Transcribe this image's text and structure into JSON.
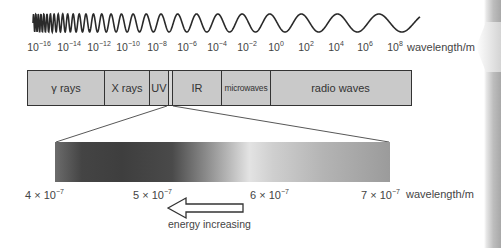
{
  "diagram": {
    "wave": {
      "description": "wave decreasing in frequency from left to right"
    },
    "axis": {
      "tick_labels": [
        {
          "base": "10",
          "exp": "−16"
        },
        {
          "base": "10",
          "exp": "−14"
        },
        {
          "base": "10",
          "exp": "−12"
        },
        {
          "base": "10",
          "exp": "−10"
        },
        {
          "base": "10",
          "exp": "−8"
        },
        {
          "base": "10",
          "exp": "−6"
        },
        {
          "base": "10",
          "exp": "−4"
        },
        {
          "base": "10",
          "exp": "−2"
        },
        {
          "base": "10",
          "exp": "0"
        },
        {
          "base": "10",
          "exp": "2"
        },
        {
          "base": "10",
          "exp": "4"
        },
        {
          "base": "10",
          "exp": "6"
        },
        {
          "base": "10",
          "exp": "8"
        }
      ],
      "unit": "wavelength/m"
    },
    "bands": [
      {
        "label": "γ rays"
      },
      {
        "label": "X rays"
      },
      {
        "label": "UV"
      },
      {
        "label": ""
      },
      {
        "label": "IR"
      },
      {
        "label": "microwaves"
      },
      {
        "label": "radio waves"
      }
    ],
    "visible_zoom": {
      "labels": [
        {
          "coef": "4 × 10",
          "exp": "−7"
        },
        {
          "coef": "5 × 10",
          "exp": "−7"
        },
        {
          "coef": "6 × 10",
          "exp": "−7"
        },
        {
          "coef": "7 × 10",
          "exp": "−7"
        }
      ],
      "unit": "wavelength/m"
    },
    "arrow": {
      "label": "energy increasing",
      "direction": "left"
    }
  }
}
